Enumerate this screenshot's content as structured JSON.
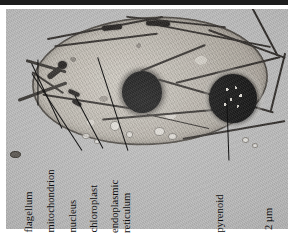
{
  "figure": {
    "type": "transmission-electron-micrograph",
    "orientation_note": "labels rotated 90 degrees counter-clockwise",
    "plate_background_color": "#b9b9b9",
    "ink_color": "#0d0d0d"
  },
  "labels": [
    {
      "id": "flagellum",
      "text": "flagellum"
    },
    {
      "id": "mitochondrion",
      "text": "mitochondrion"
    },
    {
      "id": "nucleus",
      "text": "nucleus"
    },
    {
      "id": "chloroplast",
      "text": "chloroplast"
    },
    {
      "id": "endoplasmic-reticulum",
      "line1": "endoplasmic",
      "line2": "reticulum"
    },
    {
      "id": "pyrenoid",
      "text": "pyrenoid"
    }
  ],
  "scale_bar": {
    "text": "2 µm"
  }
}
